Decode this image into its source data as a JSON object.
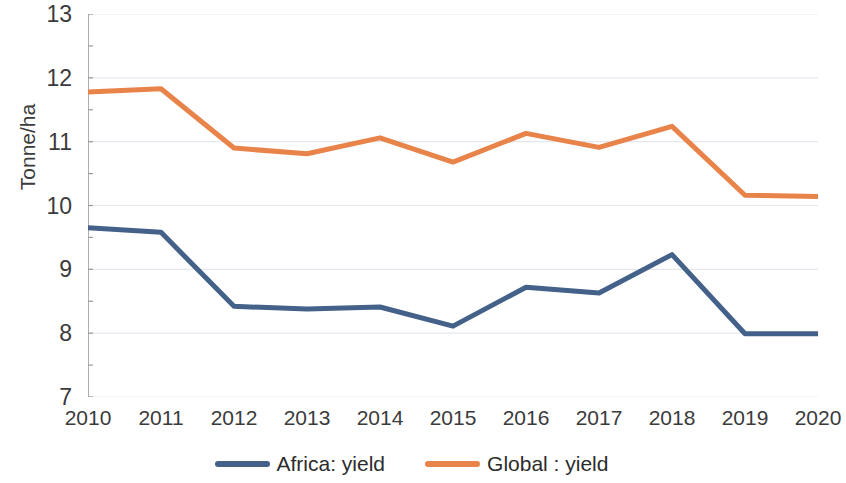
{
  "chart_data": {
    "type": "line",
    "title": "",
    "subtitle": "",
    "xlabel": "",
    "ylabel": "Tonne/ha",
    "categories": [
      "2010",
      "2011",
      "2012",
      "2013",
      "2014",
      "2015",
      "2016",
      "2017",
      "2018",
      "2019",
      "2020"
    ],
    "x": [
      2010,
      2011,
      2012,
      2013,
      2014,
      2015,
      2016,
      2017,
      2018,
      2019,
      2020
    ],
    "series": [
      {
        "name": "Africa: yield",
        "color": "#44618a",
        "values": [
          9.65,
          9.58,
          8.42,
          8.38,
          8.41,
          8.11,
          8.72,
          8.63,
          9.23,
          7.99,
          7.99
        ]
      },
      {
        "name": "Global : yield",
        "color": "#e8834a",
        "values": [
          11.78,
          11.83,
          10.9,
          10.81,
          11.06,
          10.68,
          11.13,
          10.91,
          11.24,
          10.16,
          10.14
        ]
      }
    ],
    "ylim": [
      7,
      13
    ],
    "y_ticks": [
      "13",
      "12",
      "11",
      "10",
      "9",
      "8",
      "7"
    ],
    "y_tick_values": [
      13,
      12,
      11,
      10,
      9,
      8,
      7
    ],
    "y_minor_tick_step": 0.5,
    "xlim": [
      2010,
      2020
    ],
    "grid": "horizontal",
    "legend_position": "bottom",
    "background": "#ffffff",
    "axis_color": "#9a9a9a",
    "gridline_color": "#e4e8ee",
    "text_color": "#3b3b3b",
    "line_width": 5
  },
  "legend": {
    "items": [
      {
        "label": "Africa: yield",
        "color": "#44618a",
        "swatch": "line-swatch"
      },
      {
        "label": "Global : yield",
        "color": "#e8834a",
        "swatch": "line-swatch"
      }
    ]
  }
}
